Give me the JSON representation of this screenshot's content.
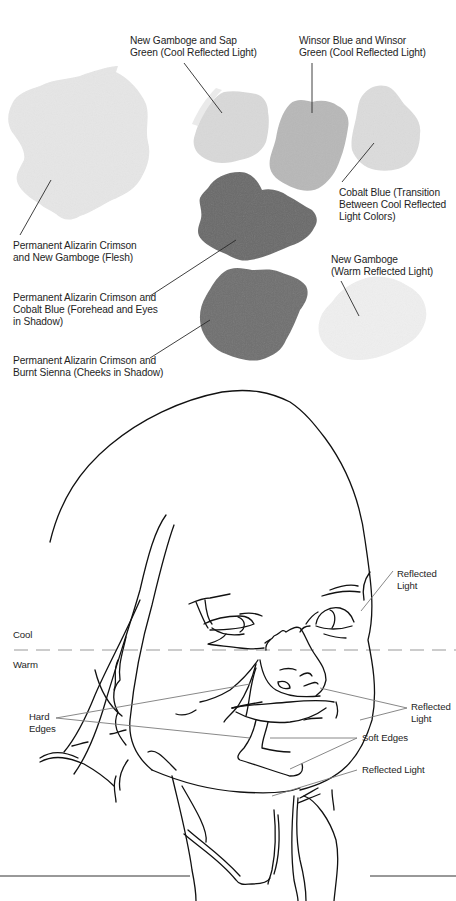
{
  "swatches": {
    "items": [
      {
        "id": "flesh",
        "lines": [
          "Permanent Alizarin Crimson",
          "and New Gamboge (Flesh)"
        ],
        "color": "#e6e6e6"
      },
      {
        "id": "gamboge-sap",
        "lines": [
          "New Gamboge and Sap",
          "Green (Cool Reflected Light)"
        ],
        "color": "#d9d9d9"
      },
      {
        "id": "winsor",
        "lines": [
          "Winsor Blue and Winsor",
          "Green (Cool Reflected Light)"
        ],
        "color": "#b8b8b8"
      },
      {
        "id": "cobalt",
        "lines": [
          "Cobalt Blue (Transition",
          "Between Cool Reflected",
          "Light Colors)"
        ],
        "color": "#dcdcdc"
      },
      {
        "id": "forehead-shadow",
        "lines": [
          "Permanent Alizarin Crimson and",
          "Cobalt Blue (Forehead and Eyes",
          "in Shadow)"
        ],
        "color": "#6a6a6a"
      },
      {
        "id": "warm-reflected",
        "lines": [
          "New Gamboge",
          "(Warm Reflected Light)"
        ],
        "color": "#efefef"
      },
      {
        "id": "cheek-shadow",
        "lines": [
          "Permanent Alizarin Crimson and",
          "Burnt Sienna (Cheeks in Shadow)"
        ],
        "color": "#707070"
      }
    ]
  },
  "drawing": {
    "zones": {
      "cool": "Cool",
      "warm": "Warm"
    },
    "annotations": {
      "reflected_light_top": [
        "Reflected",
        "Light"
      ],
      "hard_edges": [
        "Hard",
        "Edges"
      ],
      "reflected_light_right": [
        "Reflected",
        "Light"
      ],
      "soft_edges": "Soft Edges",
      "reflected_light_chin": "Reflected Light"
    },
    "colors": {
      "line": "#111111",
      "leader": "#7a7a7a",
      "divider": "#9a9a9a"
    }
  }
}
